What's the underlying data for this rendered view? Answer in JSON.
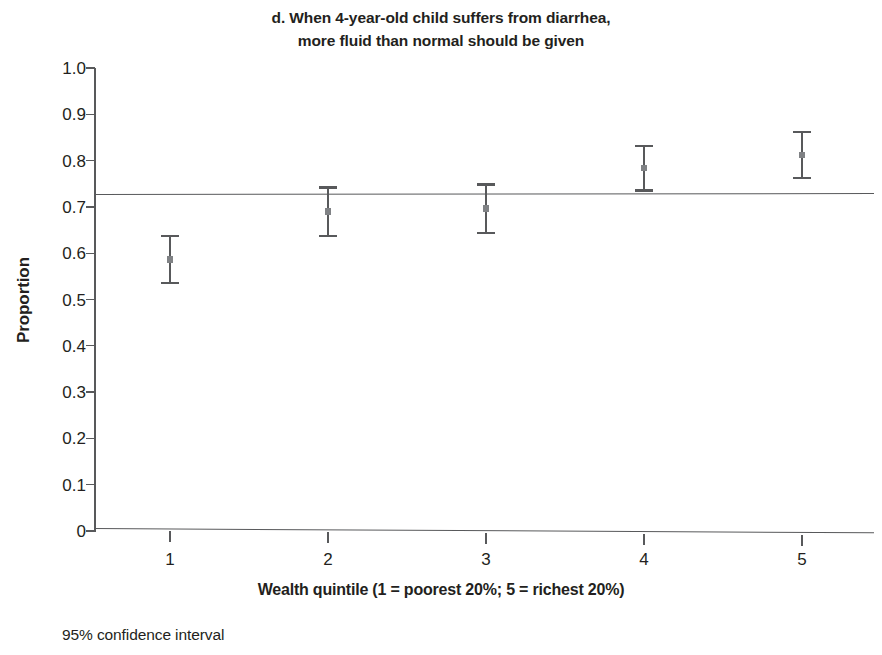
{
  "chart_data": {
    "type": "scatter",
    "title": "d. When 4-year-old child suffers from diarrhea, more fluid than normal should be given",
    "title_lines": [
      "d. When 4-year-old child suffers from diarrhea,",
      "more fluid than normal should be given"
    ],
    "xlabel": "Wealth quintile (1 = poorest 20%; 5 = richest 20%)",
    "ylabel": "Proportion",
    "categories": [
      "1",
      "2",
      "3",
      "4",
      "5"
    ],
    "x": [
      1,
      2,
      3,
      4,
      5
    ],
    "values": [
      0.587,
      0.69,
      0.696,
      0.784,
      0.812
    ],
    "ci_low": [
      0.535,
      0.637,
      0.643,
      0.735,
      0.762
    ],
    "ci_high": [
      0.637,
      0.742,
      0.748,
      0.832,
      0.862
    ],
    "error_kind": "95% confidence interval",
    "reference_line": 0.727,
    "reference_line_label": "",
    "ylim": [
      0,
      1.0
    ],
    "xlim": [
      0.65,
      5.45
    ],
    "ytick_labels": [
      "1.0",
      "0.9",
      "0.8",
      "0.7",
      "0.6",
      "0.5",
      "0.4",
      "0.3",
      "0.2",
      "0.1",
      "0"
    ],
    "ytick_values": [
      1.0,
      0.9,
      0.8,
      0.7,
      0.6,
      0.5,
      0.4,
      0.3,
      0.2,
      0.1,
      0
    ],
    "xtick_labels": [
      "1",
      "2",
      "3",
      "4",
      "5"
    ],
    "grid": false,
    "legend": false,
    "legend_position": "none",
    "footnote": "95% confidence interval",
    "colors": {
      "axis": "#58595b",
      "errorbar": "#58595b",
      "marker": "#808285",
      "reference": "#58595b",
      "text": "#231f20",
      "background": "#ffffff"
    }
  }
}
